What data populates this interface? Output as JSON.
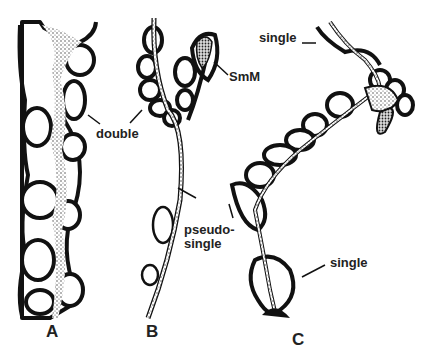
{
  "figure": {
    "panels": [
      {
        "id": "A",
        "label": "A"
      },
      {
        "id": "B",
        "label": "B"
      },
      {
        "id": "C",
        "label": "C"
      }
    ],
    "annotations": {
      "double": "double",
      "smm": "SmM",
      "pseudo_single_line1": "pseudo-",
      "pseudo_single_line2": "single",
      "single_top": "single",
      "single_bottom": "single"
    },
    "colors": {
      "outline": "#111111",
      "background": "#ffffff",
      "stipple": "#cfcfcf"
    }
  }
}
